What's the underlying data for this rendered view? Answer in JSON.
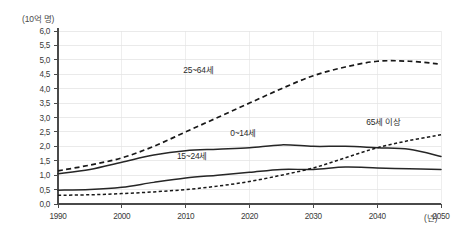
{
  "chart_data": {
    "type": "line",
    "title": "",
    "subtitle": "",
    "ylabel": "(10억 명)",
    "xlabel": "(년)",
    "xlim": [
      1990,
      2050
    ],
    "ylim": [
      0.0,
      6.0
    ],
    "grid": true,
    "legend_position": "inline-annotations",
    "x": [
      1990,
      1995,
      2000,
      2005,
      2010,
      2015,
      2020,
      2025,
      2030,
      2035,
      2040,
      2045,
      2050
    ],
    "xticks": [
      "1990",
      "2000",
      "2010",
      "2020",
      "2030",
      "2040",
      "2050"
    ],
    "yticks": [
      "0,0",
      "0,5",
      "1,0",
      "1,5",
      "2,0",
      "2,5",
      "3,0",
      "3,5",
      "4,0",
      "4,5",
      "5,0",
      "5,5",
      "6,0"
    ],
    "series": [
      {
        "name": "25~64세",
        "style": "dashed",
        "label_x": 2012,
        "label_y": 4.55,
        "values": [
          1.15,
          1.35,
          1.6,
          2.0,
          2.5,
          3.0,
          3.5,
          4.0,
          4.45,
          4.75,
          4.95,
          4.95,
          4.85
        ]
      },
      {
        "name": "0~14세",
        "style": "solid",
        "label_x": 2019,
        "label_y": 2.35,
        "values": [
          1.05,
          1.2,
          1.45,
          1.7,
          1.85,
          1.9,
          1.95,
          2.05,
          2.0,
          2.0,
          1.95,
          1.9,
          1.65
        ]
      },
      {
        "name": "15~24세",
        "style": "solid",
        "label_x": 2011,
        "label_y": 1.55,
        "values": [
          0.48,
          0.5,
          0.58,
          0.75,
          0.9,
          1.0,
          1.1,
          1.2,
          1.2,
          1.28,
          1.25,
          1.22,
          1.2
        ]
      },
      {
        "name": "65세 이상",
        "style": "dotted",
        "label_x": 2041,
        "label_y": 2.75,
        "values": [
          0.3,
          0.32,
          0.36,
          0.42,
          0.5,
          0.62,
          0.78,
          1.0,
          1.25,
          1.6,
          1.95,
          2.2,
          2.4
        ]
      }
    ]
  }
}
